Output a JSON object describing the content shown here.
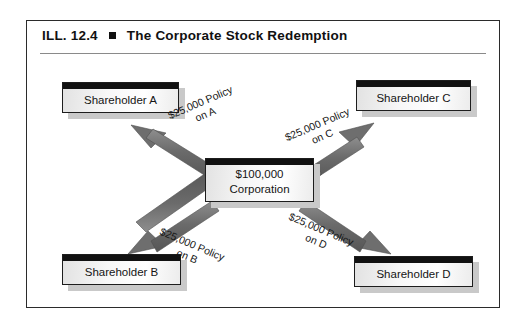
{
  "exhibit": {
    "number_label": "ILL. 12.4",
    "bullet": "square-bullet",
    "title": "The Corporate Stock Redemption"
  },
  "diagram": {
    "type": "radial-flow",
    "center": {
      "name": "corporation",
      "line1": "$100,000",
      "line2": "Corporation"
    },
    "nodes": [
      {
        "id": "a",
        "label": "Shareholder A",
        "position": "top-left"
      },
      {
        "id": "c",
        "label": "Shareholder C",
        "position": "top-right"
      },
      {
        "id": "b",
        "label": "Shareholder B",
        "position": "bottom-left"
      },
      {
        "id": "d",
        "label": "Shareholder D",
        "position": "bottom-right"
      }
    ],
    "arrows": [
      {
        "id": "a",
        "from": "corporation",
        "to": "Shareholder A",
        "line1": "$25,000 Policy",
        "line2": "on A",
        "direction": "up-left"
      },
      {
        "id": "c",
        "from": "corporation",
        "to": "Shareholder C",
        "line1": "$25,000 Policy",
        "line2": "on C",
        "direction": "up-right"
      },
      {
        "id": "b",
        "from": "corporation",
        "to": "Shareholder B",
        "line1": "$25,000 Policy",
        "line2": "on B",
        "direction": "down-left"
      },
      {
        "id": "d",
        "from": "corporation",
        "to": "Shareholder D",
        "line1": "$25,000 Policy",
        "line2": "on D",
        "direction": "down-right"
      }
    ]
  },
  "colors": {
    "frame_border": "#2b2b2b",
    "box_cap": "#111111",
    "box_fill": "#f2f2f2",
    "box_border": "#1d1d1d",
    "box_shadow": "#c9c9c9",
    "arrow": "#6e6e6e",
    "text": "#151515",
    "page_background": "#ffffff"
  }
}
